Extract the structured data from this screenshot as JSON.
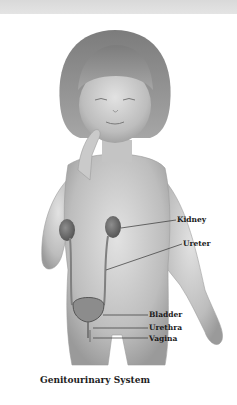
{
  "figure": {
    "caption": "Genitourinary System",
    "labels": [
      {
        "id": "kidney",
        "text": "Kidney"
      },
      {
        "id": "ureter",
        "text": "Ureter"
      },
      {
        "id": "bladder",
        "text": "Bladder"
      },
      {
        "id": "urethra",
        "text": "Urethra"
      },
      {
        "id": "vagina",
        "text": "Vagina"
      }
    ]
  },
  "colors": {
    "skin": "#b8b8b8",
    "skin_light": "#d8d8d8",
    "hair": "#8a8a8a",
    "organ": "#6e6e6e",
    "leader_line": "#333333"
  }
}
